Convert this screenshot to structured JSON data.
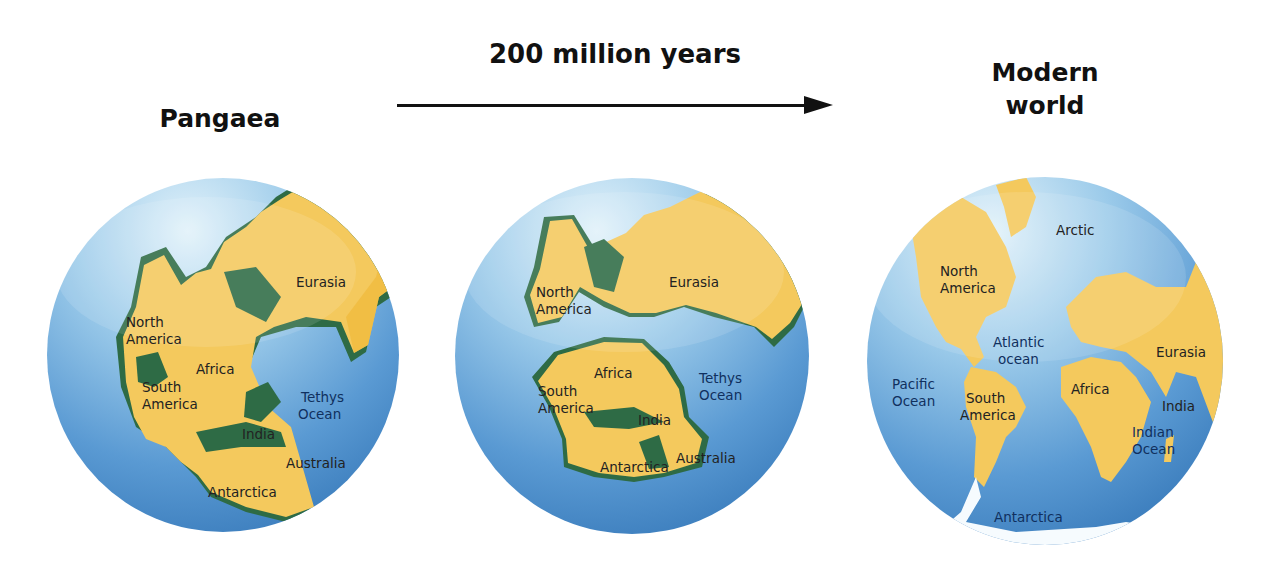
{
  "titles": {
    "start": "Pangaea",
    "elapsed": "200 million years",
    "end_line1": "Modern",
    "end_line2": "world"
  },
  "colors": {
    "ocean_light": "#d6ecf7",
    "ocean_mid": "#7fb6e0",
    "ocean_deep": "#3b7fbf",
    "land": "#f4c95d",
    "land_shade": "#f0b93a",
    "shelf": "#2e6b45",
    "text": "#222222"
  },
  "globes": [
    {
      "name": "pangaea",
      "labels": {
        "north_america_1": "North",
        "north_america_2": "America",
        "eurasia": "Eurasia",
        "africa": "Africa",
        "south_america_1": "South",
        "south_america_2": "America",
        "tethys_1": "Tethys",
        "tethys_2": "Ocean",
        "india": "India",
        "australia": "Australia",
        "antarctica": "Antarctica"
      }
    },
    {
      "name": "breakup",
      "labels": {
        "north_america_1": "North",
        "north_america_2": "America",
        "eurasia": "Eurasia",
        "africa": "Africa",
        "south_america_1": "South",
        "south_america_2": "America",
        "tethys_1": "Tethys",
        "tethys_2": "Ocean",
        "india": "India",
        "australia": "Australia",
        "antarctica": "Antarctica"
      }
    },
    {
      "name": "modern",
      "labels": {
        "arctic": "Arctic",
        "north_america_1": "North",
        "north_america_2": "America",
        "atlantic_1": "Atlantic",
        "atlantic_2": "ocean",
        "pacific_1": "Pacific",
        "pacific_2": "Ocean",
        "south_america_1": "South",
        "south_america_2": "America",
        "africa": "Africa",
        "eurasia": "Eurasia",
        "india": "India",
        "indian_1": "Indian",
        "indian_2": "Ocean",
        "antarctica": "Antarctica"
      }
    }
  ]
}
